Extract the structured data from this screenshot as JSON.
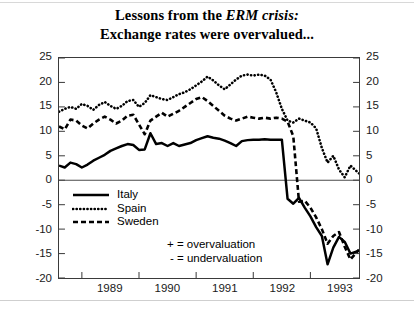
{
  "title": {
    "line1_pre": "Lessons from the ",
    "line1_ital": "ERM crisis:",
    "line2": "Exchange rates were overvalued..."
  },
  "notes": {
    "over": "+ = overvaluation",
    "under": "- = undervaluation"
  },
  "legend": {
    "items": [
      {
        "label": "Italy",
        "style": "solid"
      },
      {
        "label": "Spain",
        "style": "dotted"
      },
      {
        "label": "Sweden",
        "style": "dashed"
      }
    ]
  },
  "axes": {
    "y_ticks": [
      "25",
      "20",
      "15",
      "10",
      "5",
      "0",
      "-5",
      "-10",
      "-15",
      "-20"
    ],
    "y_ticks_right": [
      "25",
      "20",
      "15",
      "10",
      "5",
      "0",
      "-5",
      "-10",
      "-15",
      "-20"
    ],
    "x_ticks": [
      "1989",
      "1990",
      "1991",
      "1992",
      "1993"
    ]
  },
  "chart_data": {
    "type": "line",
    "title": "Lessons from the ERM crisis: Exchange rates were overvalued...",
    "xlabel": "",
    "ylabel": "",
    "ylim": [
      -20,
      25
    ],
    "xlim": [
      1988.6,
      1993.85
    ],
    "ygrid": false,
    "zero_line": true,
    "legend_position": "inside-lower-left",
    "annotations": [
      "+ = overvaluation",
      "- = undervaluation"
    ],
    "x": [
      1988.6,
      1988.7,
      1988.8,
      1988.9,
      1989.0,
      1989.1,
      1989.2,
      1989.3,
      1989.4,
      1989.5,
      1989.6,
      1989.7,
      1989.8,
      1989.9,
      1990.0,
      1990.1,
      1990.2,
      1990.3,
      1990.4,
      1990.5,
      1990.6,
      1990.7,
      1990.8,
      1990.9,
      1991.0,
      1991.1,
      1991.2,
      1991.3,
      1991.4,
      1991.5,
      1991.6,
      1991.7,
      1991.8,
      1991.9,
      1992.0,
      1992.1,
      1992.2,
      1992.3,
      1992.4,
      1992.5,
      1992.6,
      1992.7,
      1992.8,
      1992.9,
      1993.0,
      1993.1,
      1993.2,
      1993.3,
      1993.4,
      1993.5,
      1993.6,
      1993.7,
      1993.85
    ],
    "series": [
      {
        "name": "Italy",
        "style": "solid",
        "values": [
          3.0,
          2.6,
          3.6,
          3.3,
          2.6,
          3.2,
          4.0,
          4.6,
          5.2,
          6.0,
          6.5,
          7.0,
          7.4,
          7.2,
          6.2,
          6.3,
          9.6,
          7.4,
          7.6,
          7.0,
          7.6,
          7.0,
          7.3,
          7.6,
          8.2,
          8.6,
          9.0,
          8.7,
          8.5,
          8.1,
          7.6,
          7.0,
          8.0,
          8.2,
          8.3,
          8.3,
          8.4,
          8.3,
          8.3,
          8.3,
          -3.8,
          -4.8,
          -3.6,
          -5.6,
          -7.4,
          -9.6,
          -11.4,
          -17.2,
          -13.8,
          -11.6,
          -12.6,
          -15.0,
          -14.4
        ]
      },
      {
        "name": "Spain",
        "style": "dotted",
        "values": [
          14.0,
          14.6,
          15.0,
          14.6,
          15.6,
          15.2,
          14.4,
          15.4,
          16.0,
          15.2,
          14.6,
          15.2,
          16.2,
          16.4,
          15.0,
          15.8,
          17.4,
          17.0,
          16.6,
          16.4,
          17.0,
          17.6,
          18.0,
          18.6,
          19.4,
          20.2,
          21.2,
          20.4,
          19.4,
          18.6,
          19.6,
          20.6,
          21.4,
          21.6,
          21.4,
          21.6,
          21.4,
          20.6,
          18.0,
          14.6,
          12.2,
          11.8,
          12.6,
          12.2,
          11.8,
          10.6,
          6.6,
          3.6,
          5.0,
          2.2,
          0.6,
          3.0,
          1.4
        ]
      },
      {
        "name": "Sweden",
        "style": "dashed",
        "values": [
          11.0,
          10.4,
          12.4,
          12.2,
          11.2,
          10.6,
          11.6,
          12.4,
          13.0,
          12.4,
          11.6,
          12.2,
          13.2,
          13.4,
          11.4,
          9.4,
          12.2,
          13.0,
          13.8,
          13.0,
          13.6,
          14.2,
          15.0,
          15.8,
          16.6,
          17.0,
          16.2,
          15.2,
          14.2,
          13.2,
          12.6,
          12.2,
          12.6,
          13.0,
          12.8,
          12.6,
          12.8,
          12.6,
          12.8,
          12.6,
          12.0,
          9.0,
          -4.4,
          -4.2,
          -5.6,
          -7.6,
          -10.0,
          -13.0,
          -11.4,
          -10.6,
          -13.6,
          -16.2,
          -14.2
        ]
      }
    ]
  }
}
